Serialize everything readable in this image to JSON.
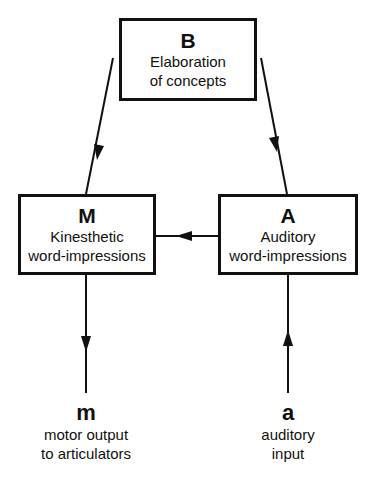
{
  "diagram": {
    "nodes": {
      "B": {
        "key": "B",
        "lines": [
          "Elaboration",
          "of concepts"
        ]
      },
      "M": {
        "key": "M",
        "lines": [
          "Kinesthetic",
          "word-impressions"
        ]
      },
      "A": {
        "key": "A",
        "lines": [
          "Auditory",
          "word-impressions"
        ]
      }
    },
    "terminals": {
      "m": {
        "key": "m",
        "lines": [
          "motor output",
          "to articulators"
        ]
      },
      "a": {
        "key": "a",
        "lines": [
          "auditory",
          "input"
        ]
      }
    },
    "edges": [
      {
        "from": "B",
        "to": "M"
      },
      {
        "from": "A",
        "to": "B"
      },
      {
        "from": "A",
        "to": "M"
      },
      {
        "from": "M",
        "to": "m"
      },
      {
        "from": "a",
        "to": "A"
      }
    ],
    "colors": {
      "stroke": "#111111",
      "background": "#ffffff"
    }
  }
}
